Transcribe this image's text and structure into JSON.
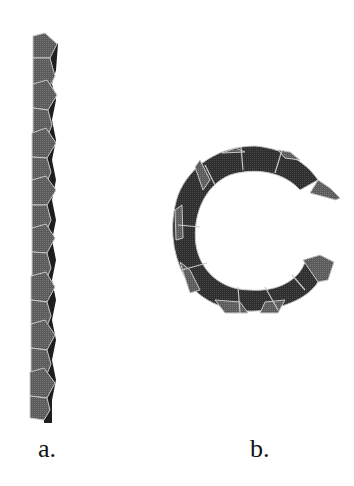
{
  "figure": {
    "panels": [
      {
        "id": "a",
        "label": "a.",
        "description": "straight column of linked pentagonal units",
        "pentagon_count": 11
      },
      {
        "id": "b",
        "label": "b.",
        "description": "C-shaped arc of linked pentagonal units",
        "pentagon_count": 9
      }
    ],
    "colors": {
      "face_light": "#6e6e6e",
      "face_dark": "#3a3a3a",
      "side_dark": "#222222",
      "edge": "#c8c8c8"
    }
  }
}
